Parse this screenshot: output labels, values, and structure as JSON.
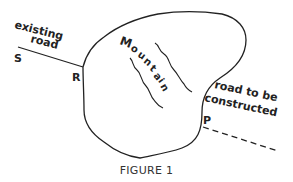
{
  "figure": {
    "caption": "FIGURE 1",
    "region_label": "Mountain",
    "region_letters": [
      "M",
      "o",
      "u",
      "n",
      "t",
      "a",
      "i",
      "n"
    ],
    "existing_road_label_line1": "existing",
    "existing_road_label_line2": "road",
    "new_road_label_line1": "road to be",
    "new_road_label_line2": "constructed",
    "points": {
      "S": "S",
      "R": "R",
      "P": "P"
    },
    "colors": {
      "ink": "#222222",
      "background": "#ffffff"
    }
  }
}
